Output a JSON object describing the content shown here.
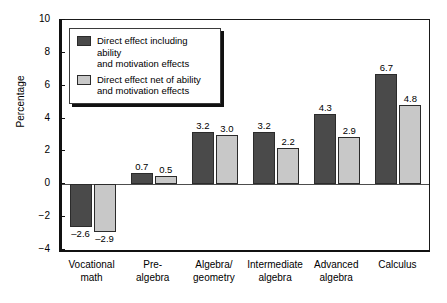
{
  "chart_data": {
    "type": "bar",
    "title": "",
    "xlabel": "",
    "ylabel": "Percentage",
    "ylim": [
      -4,
      10
    ],
    "yticks": [
      "10",
      "8",
      "6",
      "4",
      "2",
      "0",
      "−2",
      "−4"
    ],
    "grid": false,
    "legend_position": "upper left inside",
    "categories": [
      "Vocational\nmath",
      "Pre-\nalgebra",
      "Algebra/\ngeometry",
      "Intermediate\nalgebra",
      "Advanced\nalgebra",
      "Calculus"
    ],
    "series": [
      {
        "name": "Direct effect including ability\nand motivation effects",
        "color": "#4a4a4a",
        "values": [
          -2.6,
          0.7,
          3.2,
          3.2,
          4.3,
          6.7
        ],
        "labels": [
          "–2.6",
          "0.7",
          "3.2",
          "3.2",
          "4.3",
          "6.7"
        ]
      },
      {
        "name": "Direct effect net of ability\nand motivation effects",
        "color": "#c8c8c8",
        "values": [
          -2.9,
          0.5,
          3.0,
          2.2,
          2.9,
          4.8
        ],
        "labels": [
          "–2.9",
          "0.5",
          "3.0",
          "2.2",
          "2.9",
          "4.8"
        ]
      }
    ]
  },
  "axis": {
    "y_title": "Percentage",
    "y_tick_labels": [
      "10",
      "8",
      "6",
      "4",
      "2",
      "0",
      "−2",
      "−4"
    ],
    "x_tick_labels": [
      "Vocational\nmath",
      "Pre-\nalgebra",
      "Algebra/\ngeometry",
      "Intermediate\nalgebra",
      "Advanced\nalgebra",
      "Calculus"
    ]
  },
  "legend": {
    "entries": [
      {
        "label": "Direct effect including ability\nand motivation effects",
        "color": "#4a4a4a"
      },
      {
        "label": "Direct effect net of ability\nand motivation effects",
        "color": "#c8c8c8"
      }
    ]
  },
  "values": {
    "dark": [
      "–2.6",
      "0.7",
      "3.2",
      "3.2",
      "4.3",
      "6.7"
    ],
    "light": [
      "–2.9",
      "0.5",
      "3.0",
      "2.2",
      "2.9",
      "4.8"
    ]
  }
}
